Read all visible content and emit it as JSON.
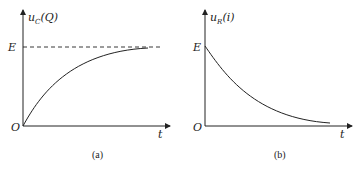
{
  "figure": {
    "panel_a": {
      "y_label_main": "u",
      "y_label_sub": "C",
      "y_label_arg": "(Q)",
      "level_label": "E",
      "origin_label": "O",
      "x_label": "t",
      "caption": "(a)",
      "curve": "rising exponential approaching E (dashed asymptote)"
    },
    "panel_b": {
      "y_label_main": "u",
      "y_label_sub": "R",
      "y_label_arg": "(i)",
      "level_label": "E",
      "origin_label": "O",
      "x_label": "t",
      "caption": "(b)",
      "curve": "decaying exponential from E toward 0"
    }
  }
}
